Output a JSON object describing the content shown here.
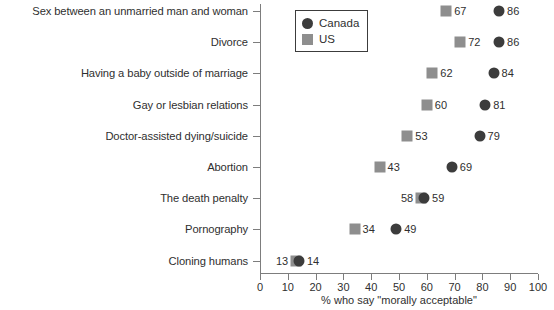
{
  "chart_data": {
    "type": "scatter",
    "subtype": "dot-plot",
    "title": "",
    "xlabel": "% who say \"morally acceptable\"",
    "ylabel": "",
    "xlim": [
      0,
      100
    ],
    "xticks": [
      0,
      10,
      20,
      30,
      40,
      50,
      60,
      70,
      80,
      90,
      100
    ],
    "xtick_labels": [
      "0",
      "10",
      "20",
      "30",
      "40",
      "50",
      "60",
      "70",
      "80",
      "90",
      "100"
    ],
    "grid": false,
    "legend_position": "top-left-inside",
    "categories": [
      "Sex between an unmarried man and woman",
      "Divorce",
      "Having a baby outside of marriage",
      "Gay or lesbian relations",
      "Doctor-assisted dying/suicide",
      "Abortion",
      "The death penalty",
      "Pornography",
      "Cloning humans"
    ],
    "series": [
      {
        "name": "Canada",
        "marker": "circle",
        "color": "#3c3c3c",
        "values": [
          86,
          86,
          84,
          81,
          79,
          69,
          59,
          49,
          14
        ]
      },
      {
        "name": "US",
        "marker": "square",
        "color": "#8e8e8e",
        "values": [
          67,
          72,
          62,
          60,
          53,
          43,
          58,
          34,
          13
        ]
      }
    ],
    "point_labels": [
      {
        "category": "Sex between an unmarried man and woman",
        "us": "67",
        "us_side": "right",
        "canada": "86",
        "canada_side": "right"
      },
      {
        "category": "Divorce",
        "us": "72",
        "us_side": "right",
        "canada": "86",
        "canada_side": "right"
      },
      {
        "category": "Having a baby outside of marriage",
        "us": "62",
        "us_side": "right",
        "canada": "84",
        "canada_side": "right"
      },
      {
        "category": "Gay or lesbian relations",
        "us": "60",
        "us_side": "right",
        "canada": "81",
        "canada_side": "right"
      },
      {
        "category": "Doctor-assisted dying/suicide",
        "us": "53",
        "us_side": "right",
        "canada": "79",
        "canada_side": "right"
      },
      {
        "category": "Abortion",
        "us": "43",
        "us_side": "right",
        "canada": "69",
        "canada_side": "right"
      },
      {
        "category": "The death penalty",
        "us": "58",
        "us_side": "left",
        "canada": "59",
        "canada_side": "right"
      },
      {
        "category": "Pornography",
        "us": "34",
        "us_side": "right",
        "canada": "49",
        "canada_side": "right"
      },
      {
        "category": "Cloning humans",
        "us": "13",
        "us_side": "left",
        "canada": "14",
        "canada_side": "right"
      }
    ]
  },
  "legend": {
    "entries": [
      {
        "label": "Canada",
        "marker": "circle"
      },
      {
        "label": "US",
        "marker": "square"
      }
    ]
  },
  "axis": {
    "x_title": "% who say \"morally acceptable\""
  }
}
